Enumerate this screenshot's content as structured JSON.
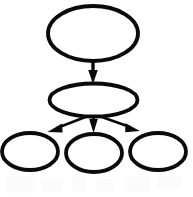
{
  "diagram": {
    "background_color": "#ffffff",
    "stroke_color": "#0a0a0a",
    "fill_color": "#ffffff",
    "stroke_width": 3.6,
    "canvas": {
      "width": 193,
      "height": 197
    },
    "nodes": [
      {
        "id": "root",
        "label": "",
        "shape": "ellipse",
        "cx": 93,
        "cy": 33.5,
        "rx": 45,
        "ry": 27.5,
        "level": 0
      },
      {
        "id": "mid",
        "label": "",
        "shape": "ellipse",
        "cx": 93.5,
        "cy": 100,
        "rx": 44,
        "ry": 16.5,
        "level": 1
      },
      {
        "id": "leaf-left",
        "label": "",
        "shape": "ellipse",
        "cx": 30,
        "cy": 151.5,
        "rx": 28,
        "ry": 18.5,
        "level": 2
      },
      {
        "id": "leaf-center",
        "label": "",
        "shape": "ellipse",
        "cx": 94,
        "cy": 153,
        "rx": 28,
        "ry": 19,
        "level": 2
      },
      {
        "id": "leaf-right",
        "label": "",
        "shape": "ellipse",
        "cx": 158,
        "cy": 151.5,
        "rx": 28,
        "ry": 18.5,
        "level": 2
      }
    ],
    "edges": [
      {
        "id": "edge-root-mid",
        "label": "",
        "from": "root",
        "to": "mid",
        "x1": 93,
        "y1": 61,
        "x2": 93,
        "y2": 82,
        "arrowhead": "filled-triangle",
        "direction": "down"
      },
      {
        "id": "edge-mid-left",
        "label": "",
        "from": "mid",
        "to": "leaf-left",
        "x1": 88,
        "y1": 116,
        "x2": 49,
        "y2": 132,
        "arrowhead": "filled-triangle",
        "direction": "down-left"
      },
      {
        "id": "edge-mid-center",
        "label": "",
        "from": "mid",
        "to": "leaf-center",
        "x1": 93.5,
        "y1": 116,
        "x2": 93.5,
        "y2": 133,
        "arrowhead": "filled-triangle",
        "direction": "down"
      },
      {
        "id": "edge-mid-right",
        "label": "",
        "from": "mid",
        "to": "leaf-right",
        "x1": 99,
        "y1": 116,
        "x2": 139,
        "y2": 131,
        "arrowhead": "filled-triangle",
        "direction": "down-right"
      }
    ],
    "artifacts": {
      "description": "faint light-gray scan smudges along the lower edge",
      "color": "#fbfbfb",
      "blobs": [
        {
          "x": 6,
          "y": 176,
          "width": 30,
          "height": 17
        },
        {
          "x": 41,
          "y": 178,
          "width": 22,
          "height": 14
        },
        {
          "x": 72,
          "y": 175,
          "width": 14,
          "height": 16
        },
        {
          "x": 96,
          "y": 179,
          "width": 18,
          "height": 12
        },
        {
          "x": 124,
          "y": 177,
          "width": 26,
          "height": 15
        },
        {
          "x": 158,
          "y": 176,
          "width": 24,
          "height": 14
        }
      ]
    }
  }
}
